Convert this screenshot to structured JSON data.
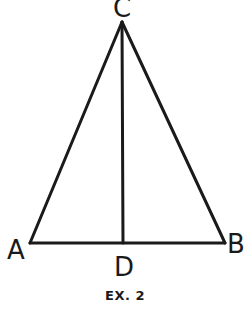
{
  "figure": {
    "caption": "EX. 2",
    "stroke_color": "#1a1a1a",
    "background": "#ffffff",
    "points": {
      "A": {
        "label": "A",
        "x": 30,
        "y": 243
      },
      "B": {
        "label": "B",
        "x": 225,
        "y": 243
      },
      "C": {
        "label": "C",
        "x": 122,
        "y": 22
      },
      "D": {
        "label": "D",
        "x": 123,
        "y": 243
      }
    },
    "segments": [
      {
        "name": "AC",
        "from": "A",
        "to": "C"
      },
      {
        "name": "BC",
        "from": "B",
        "to": "C"
      },
      {
        "name": "AB",
        "from": "A",
        "to": "B"
      },
      {
        "name": "CD",
        "from": "C",
        "to": "D"
      }
    ]
  }
}
